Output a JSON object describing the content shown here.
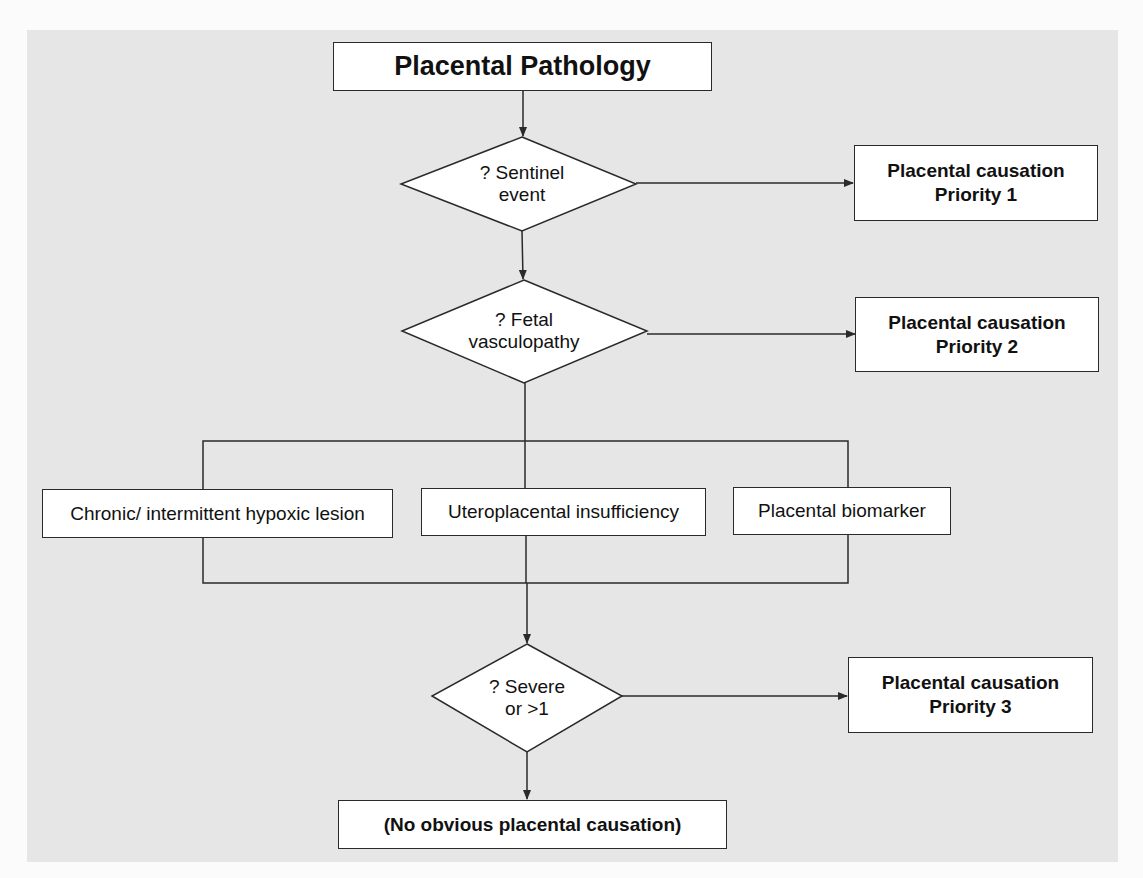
{
  "colors": {
    "page_background": "#fbfbfb",
    "panel_background": "#e6e6e6",
    "box_fill": "#ffffff",
    "line": "#2a2a2a"
  },
  "title": "Placental Pathology",
  "decisions": [
    {
      "id": "sentinel",
      "line1": "? Sentinel",
      "line2": "event"
    },
    {
      "id": "fetal",
      "line1": "? Fetal",
      "line2": "vasculopathy"
    },
    {
      "id": "severe",
      "line1": "? Severe",
      "line2": "or >1"
    }
  ],
  "outcomes": [
    {
      "line1": "Placental causation",
      "line2": "Priority 1"
    },
    {
      "line1": "Placental causation",
      "line2": "Priority 2"
    },
    {
      "line1": "Placental causation",
      "line2": "Priority 3"
    }
  ],
  "categories": [
    "Chronic/ intermittent hypoxic lesion",
    "Uteroplacental insufficiency",
    "Placental biomarker"
  ],
  "final": "(No obvious placental causation)"
}
